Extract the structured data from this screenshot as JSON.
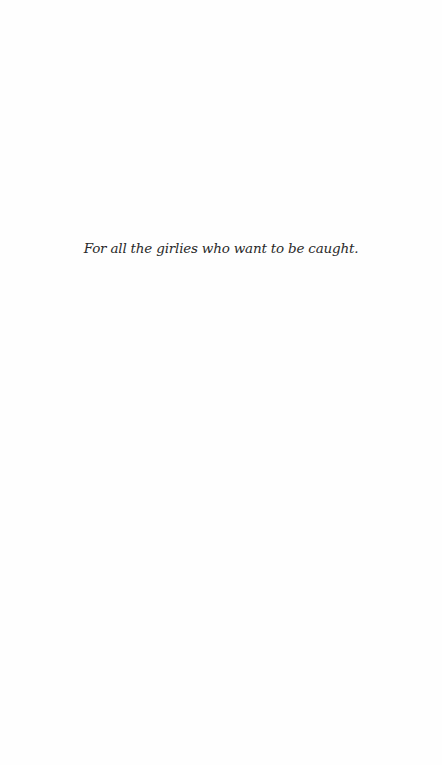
{
  "page": {
    "background": "#fefefe",
    "dedication": "For all the girlies who want to be caught."
  }
}
